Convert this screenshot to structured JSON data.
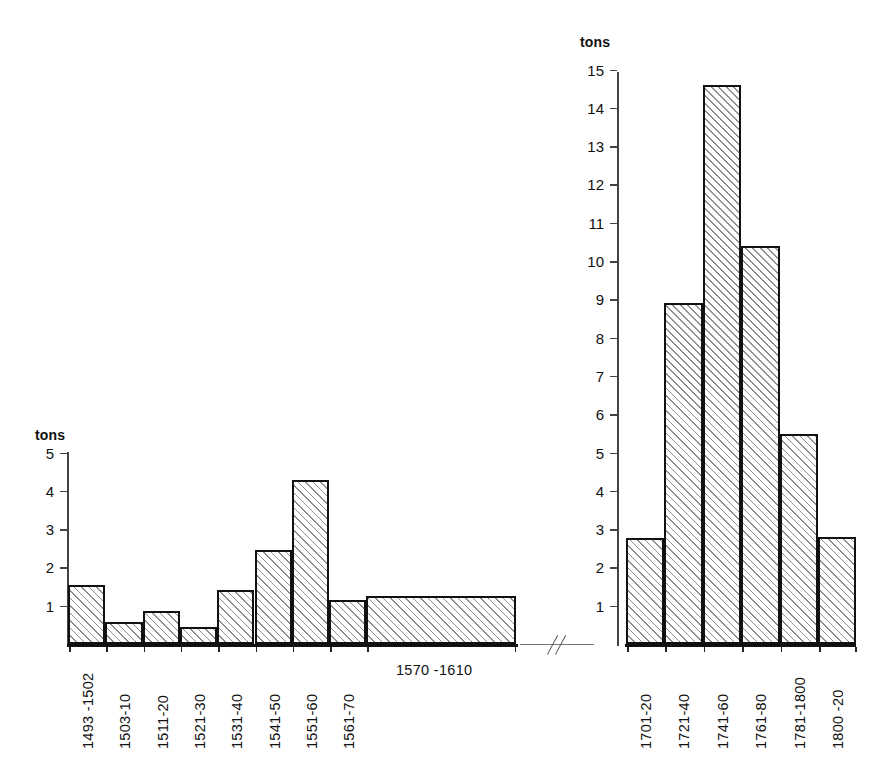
{
  "figure": {
    "background_color": "#ffffff",
    "bar_fill_color": "#fbfbfb",
    "bar_hatch_color": "#8e8e8e",
    "bar_border_color": "#111111",
    "axis_color": "#444444"
  },
  "chart_data": [
    {
      "type": "bar",
      "id": "left-panel",
      "title": "",
      "xlabel": "",
      "ylabel": "tons",
      "unit_label": "tons",
      "ylim": [
        0,
        5
      ],
      "ytick_labels": [
        "5",
        "4",
        "3",
        "2",
        "1"
      ],
      "ytick_values": [
        5,
        4,
        3,
        2,
        1
      ],
      "grid": false,
      "legend": null,
      "categories": [
        "1493 -1502",
        "1503-10",
        "1511-20",
        "1521-30",
        "1531-40",
        "1541-50",
        "1551-60",
        "1561-70",
        "1570 -1610"
      ],
      "values": [
        1.55,
        0.58,
        0.87,
        0.45,
        1.4,
        2.45,
        4.27,
        1.15,
        1.25
      ],
      "bar_widths": [
        1,
        1,
        1,
        1,
        1,
        1,
        1,
        1,
        4
      ],
      "label_orientation": [
        "vertical",
        "vertical",
        "vertical",
        "vertical",
        "vertical",
        "vertical",
        "vertical",
        "vertical",
        "horizontal"
      ]
    },
    {
      "type": "bar",
      "id": "right-panel",
      "title": "",
      "xlabel": "",
      "ylabel": "tons",
      "unit_label": "tons",
      "ylim": [
        0,
        15
      ],
      "ytick_labels": [
        "15",
        "14",
        "13",
        "12",
        "11",
        "10",
        "9",
        "8",
        "7",
        "6",
        "5",
        "4",
        "3",
        "2",
        "1"
      ],
      "ytick_values": [
        15,
        14,
        13,
        12,
        11,
        10,
        9,
        8,
        7,
        6,
        5,
        4,
        3,
        2,
        1
      ],
      "grid": false,
      "legend": null,
      "categories": [
        "1701-20",
        "1721-40",
        "1741-60",
        "1761-80",
        "1781-1800",
        "1800 -20"
      ],
      "values": [
        2.77,
        8.9,
        14.6,
        10.4,
        5.48,
        2.8
      ],
      "bar_widths": [
        1,
        1,
        1,
        1,
        1,
        1
      ],
      "label_orientation": [
        "vertical",
        "vertical",
        "vertical",
        "vertical",
        "vertical",
        "vertical"
      ]
    }
  ],
  "annotations": {
    "axis_break": "//"
  }
}
